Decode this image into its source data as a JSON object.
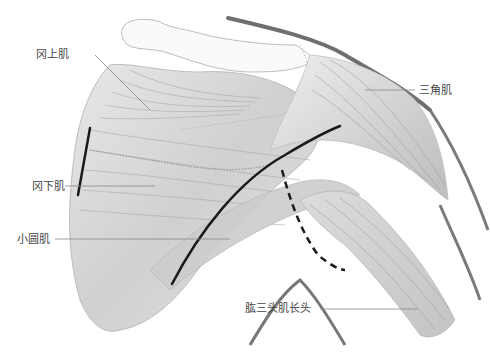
{
  "figure": {
    "type": "anatomical-illustration"
  },
  "labels": [
    {
      "id": "supraspinatus",
      "text": "冈上肌",
      "x": 36,
      "y": 49
    },
    {
      "id": "deltoid",
      "text": "三角肌",
      "x": 419,
      "y": 85
    },
    {
      "id": "infraspinatus",
      "text": "冈下肌",
      "x": 32,
      "y": 181
    },
    {
      "id": "teres-minor",
      "text": "小圆肌",
      "x": 17,
      "y": 234
    },
    {
      "id": "triceps-long-head",
      "text": "肱三头肌长头",
      "x": 245,
      "y": 303
    }
  ],
  "colors": {
    "line": "#888888",
    "muscle_fill": "#d6d6d6",
    "bold_line": "#1a1a1a",
    "outline": "#bdbdbd",
    "skin_contour": "#6f6f6f"
  }
}
